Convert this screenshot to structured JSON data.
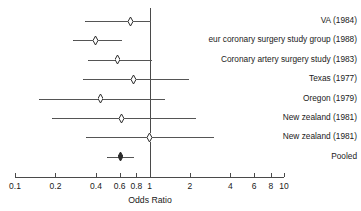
{
  "chart_data": {
    "type": "forest",
    "title": "",
    "xlabel": "Odds Ratio",
    "ylabel": "",
    "xscale": "log",
    "xlim": [
      0.1,
      10
    ],
    "tick_labels": [
      "0.1",
      "0.2",
      "0.4",
      "0.6",
      "0.8",
      "1",
      "2",
      "4",
      "6",
      "8",
      "10"
    ],
    "tick_values": [
      0.1,
      0.2,
      0.4,
      0.6,
      0.8,
      1,
      2,
      4,
      6,
      8,
      10
    ],
    "null_value": 1,
    "grid": false,
    "legend": "none",
    "studies": [
      {
        "label": "VA (1984)",
        "estimate": 0.72,
        "ci_low": 0.33,
        "ci_high": 1.02,
        "pooled": false
      },
      {
        "label": "eur coronary surgery study group (1988)",
        "estimate": 0.4,
        "ci_low": 0.27,
        "ci_high": 0.62,
        "pooled": false
      },
      {
        "label": "Coronary artery surgery study (1983)",
        "estimate": 0.58,
        "ci_low": 0.35,
        "ci_high": 1.05,
        "pooled": false
      },
      {
        "label": "Texas (1977)",
        "estimate": 0.76,
        "ci_low": 0.32,
        "ci_high": 1.95,
        "pooled": false
      },
      {
        "label": "Oregon (1979)",
        "estimate": 0.43,
        "ci_low": 0.15,
        "ci_high": 1.3,
        "pooled": false
      },
      {
        "label": "New zealand (1981)",
        "estimate": 0.62,
        "ci_low": 0.19,
        "ci_high": 2.2,
        "pooled": false
      },
      {
        "label": "New zealand (1981)",
        "estimate": 1.0,
        "ci_low": 0.34,
        "ci_high": 3.0,
        "pooled": false
      },
      {
        "label": "Pooled",
        "estimate": 0.61,
        "ci_low": 0.48,
        "ci_high": 0.77,
        "pooled": true
      }
    ]
  },
  "colors": {
    "axis": "#4a4a4a",
    "line": "#555555",
    "text": "#1a1a1a",
    "background": "#ffffff"
  }
}
